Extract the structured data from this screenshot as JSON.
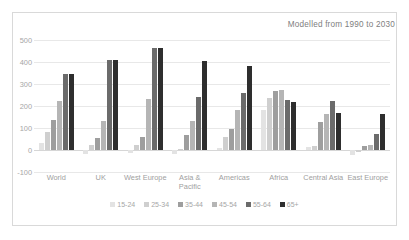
{
  "chart_data": {
    "type": "bar",
    "title": "Modelled from 1990 to 2030",
    "xlabel": "",
    "ylabel": "",
    "ylim": [
      -100,
      500
    ],
    "yticks": [
      500,
      400,
      300,
      200,
      100,
      0,
      -100
    ],
    "grid": true,
    "legend_position": "bottom",
    "categories": [
      "World",
      "UK",
      "West Europe",
      "Asia &\nPacific",
      "Americas",
      "Africa",
      "Central Asia",
      "East Europe"
    ],
    "series": [
      {
        "name": "15-24",
        "color": "#e3e3e3",
        "values": [
          30,
          -18,
          -12,
          -20,
          8,
          180,
          15,
          -22
        ]
      },
      {
        "name": "25-34",
        "color": "#cfcfcf",
        "values": [
          80,
          22,
          25,
          3,
          58,
          237,
          18,
          -10
        ]
      },
      {
        "name": "35-44",
        "color": "#9e9e9e",
        "values": [
          135,
          55,
          58,
          68,
          97,
          268,
          128,
          20
        ]
      },
      {
        "name": "45-54",
        "color": "#b5b5b5",
        "values": [
          225,
          132,
          232,
          133,
          183,
          272,
          162,
          22
        ]
      },
      {
        "name": "55-64",
        "color": "#6b6b6b",
        "values": [
          345,
          410,
          465,
          242,
          258,
          228,
          224,
          73
        ]
      },
      {
        "name": "65+",
        "color": "#2e2e2e",
        "values": [
          345,
          410,
          465,
          406,
          382,
          220,
          166,
          164
        ]
      }
    ]
  }
}
